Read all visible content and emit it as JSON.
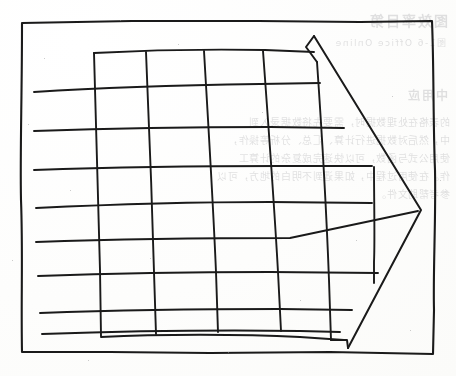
{
  "page": {
    "kind": "scanned-document-page",
    "width": 456,
    "height": 376,
    "background_color": "#fefefe",
    "ink_color": "#1a1a1a",
    "bleed_through_color": "#4a4a52"
  },
  "bleed_through": {
    "note": "faint mirrored text showing through from the reverse side of the page",
    "title": "图效率目第",
    "subtitle": "图1-6 Office Online",
    "heading2": "中用应",
    "body": [
      "的表格在处理数据时，需要先将数据录入到",
      "中，然后对数据进行计算、汇总、分析等操作，",
      "使用公式与函数，可以快速完成复杂的计算工",
      "作。在使用过程中，如果遇到不明白的地方，可以",
      "参考帮助文件。"
    ]
  },
  "diagram": {
    "name": "hand-drawn grid with right-pointing arrow",
    "outer_frame": {
      "label": "outer border rectangle",
      "top_left": [
        21,
        21
      ],
      "bottom_right": [
        434,
        354
      ]
    },
    "grid": {
      "label": "spreadsheet grid",
      "horizontal_line_count": 8,
      "vertical_line_count": 6,
      "horizontal_lines_y": [
        85,
        128,
        168,
        205,
        240,
        273,
        313,
        333
      ],
      "vertical_lines_x": [
        94,
        146,
        204,
        263,
        317,
        374
      ]
    },
    "arrow": {
      "label": "block arrow pointing right",
      "direction": "right",
      "tip": [
        421,
        210
      ],
      "top_notch": [
        314,
        36
      ],
      "bottom_notch": [
        347,
        340
      ],
      "style": "outline, no fill"
    }
  }
}
